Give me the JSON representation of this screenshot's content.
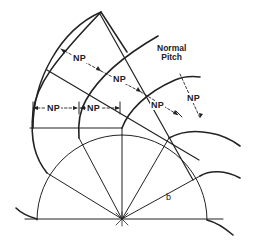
{
  "diagram": {
    "labels": {
      "np_1": "NP",
      "np_2": "NP",
      "np_3": "NP",
      "np_4": "NP",
      "np_5": "NP",
      "np_6": "NP",
      "normal_pitch_line1": "Normal",
      "normal_pitch_line2": "Pitch",
      "base_radius": "b"
    },
    "colors": {
      "line": "#222222",
      "background": "#ffffff"
    }
  }
}
